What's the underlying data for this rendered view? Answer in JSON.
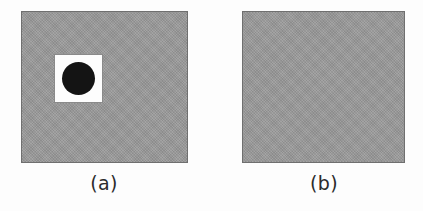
{
  "figure": {
    "background_color": "#fdfdfd",
    "width": 423,
    "height": 211,
    "panels": [
      {
        "id": "a",
        "caption": "(a)",
        "fill_color": "#9b9b9b",
        "border_color": "#6f6f6f",
        "x": 21,
        "y": 11,
        "width": 167,
        "height": 152,
        "shapes": [
          {
            "kind": "square",
            "name": "white-square",
            "color": "#fdfdfd",
            "x": 32,
            "y": 42,
            "width": 49,
            "height": 49
          },
          {
            "kind": "circle",
            "name": "black-disc",
            "color": "#141414",
            "cx": 56,
            "cy": 66,
            "diameter": 33
          }
        ]
      },
      {
        "id": "b",
        "caption": "(b)",
        "fill_color": "#9b9b9b",
        "border_color": "#6f6f6f",
        "x": 242,
        "y": 11,
        "width": 163,
        "height": 152,
        "shapes": [
          {
            "kind": "circle",
            "name": "black-disc",
            "color": "#171717",
            "cx": 273,
            "cy": 67,
            "diameter": 33
          }
        ]
      }
    ]
  }
}
